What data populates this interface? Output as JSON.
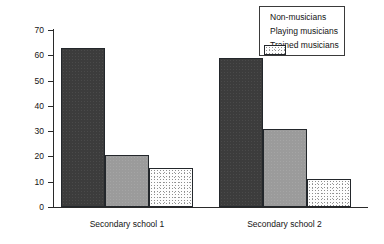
{
  "chart_data": {
    "type": "bar",
    "title": "",
    "xlabel": "",
    "ylabel": "Percentage of total",
    "ylim": [
      0,
      70
    ],
    "ytick_interval": 10,
    "yticks": [
      70,
      60,
      50,
      40,
      30,
      20,
      10,
      0
    ],
    "ytick_labels": [
      "70",
      "60",
      "50",
      "40",
      "30",
      "20",
      "10",
      "0"
    ],
    "grid": false,
    "legend_position": "top-right",
    "categories": [
      "Secondary school 1",
      "Secondary school 2"
    ],
    "series": [
      {
        "name": "Non-musicians",
        "color": "#3c3c3c",
        "pattern": "solid-dark",
        "values": [
          63,
          59
        ]
      },
      {
        "name": "Playing musicians",
        "color": "#9b9b9b",
        "pattern": "solid-gray",
        "values": [
          20.5,
          31
        ]
      },
      {
        "name": "Trained musicians",
        "color": "#fdfdfd",
        "pattern": "stipple-dots",
        "values": [
          15.5,
          11
        ]
      }
    ]
  },
  "legend": {
    "items": [
      {
        "label": "Non-musicians"
      },
      {
        "label": "Playing musicians"
      },
      {
        "label": "Trained musicians"
      }
    ]
  },
  "axes": {
    "y_title": "Percentage of total"
  }
}
